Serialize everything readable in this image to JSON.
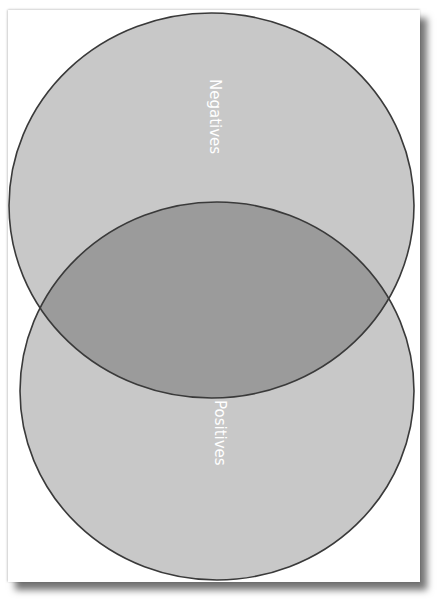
{
  "diagram": {
    "type": "venn",
    "sets": [
      {
        "id": "negatives",
        "label": "Negatives",
        "position": "top",
        "fill": "#c8c8c8",
        "stroke": "#3a3a3a"
      },
      {
        "id": "positives",
        "label": "Positives",
        "position": "bottom",
        "fill": "#c8c8c8",
        "stroke": "#3a3a3a"
      }
    ],
    "intersection": {
      "fill": "#9a9a9a"
    },
    "label_orientation": "rotated 90° clockwise",
    "label_color": "#ffffff",
    "background": "#ffffff"
  }
}
